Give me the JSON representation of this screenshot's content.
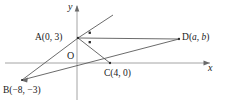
{
  "figure": {
    "type": "coordinate-geometry-diagram",
    "axes": {
      "x_label": "x",
      "y_label": "y",
      "origin_label": "O"
    },
    "points": [
      {
        "id": "A",
        "label": "A(0, 3)",
        "name": "A",
        "coords": [
          0,
          3
        ],
        "px": [
          78,
          38
        ]
      },
      {
        "id": "B",
        "label": "B(−8, −3)",
        "name": "B",
        "coords": [
          -8,
          -3
        ],
        "px": [
          22,
          80
        ]
      },
      {
        "id": "C",
        "label": "C(4, 0)",
        "name": "C",
        "coords": [
          4,
          0
        ],
        "px": [
          110,
          63
        ]
      },
      {
        "id": "D",
        "label": "D(a, b)",
        "name": "D",
        "coords": [
          "a",
          "b"
        ],
        "px": [
          179,
          39
        ]
      }
    ],
    "segments": [
      {
        "from": "A",
        "to": "B"
      },
      {
        "from": "A",
        "to": "C"
      },
      {
        "from": "A",
        "to": "D"
      },
      {
        "from": "B",
        "to": "C"
      },
      {
        "from": "C",
        "to": "D"
      },
      {
        "from": "B",
        "to": "D"
      }
    ],
    "ray_from_A": {
      "label": "ray through A up-right",
      "to_px": [
        113,
        15
      ]
    },
    "angle_markers": {
      "count": 2,
      "meaning": "equal-angles-at-A"
    },
    "colors": {
      "stroke": "#4a4a4a",
      "axis": "#8a8a8a",
      "text": "#1a1a1a",
      "background": "#ffffff"
    }
  }
}
